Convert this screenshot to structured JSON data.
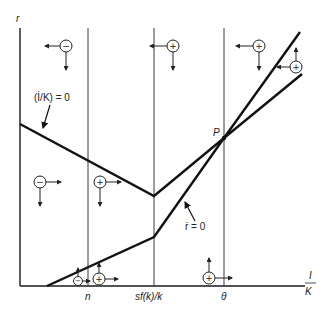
{
  "diagram": {
    "type": "phase-diagram",
    "y_axis_label": "r",
    "x_axis_label_num": "I",
    "x_axis_label_den": "K",
    "x_ticks": [
      "n",
      "sf(k)/k",
      "θ"
    ],
    "curves": [
      {
        "name": "investment-rate-stationary",
        "label": "(İ/K) = 0"
      },
      {
        "name": "interest-rate-stationary",
        "label": "ṙ = 0"
      }
    ],
    "point_label": "P",
    "regions": [
      {
        "sign": "−",
        "position": "top-left"
      },
      {
        "sign": "+",
        "position": "top-middle"
      },
      {
        "sign": "+",
        "position": "top-right"
      },
      {
        "sign": "+",
        "position": "far-right"
      },
      {
        "sign": "−",
        "position": "middle-left"
      },
      {
        "sign": "+",
        "position": "middle-center"
      },
      {
        "sign": "−",
        "position": "bottom-left"
      },
      {
        "sign": "+",
        "position": "bottom-center-left"
      },
      {
        "sign": "+",
        "position": "bottom-right"
      }
    ]
  }
}
